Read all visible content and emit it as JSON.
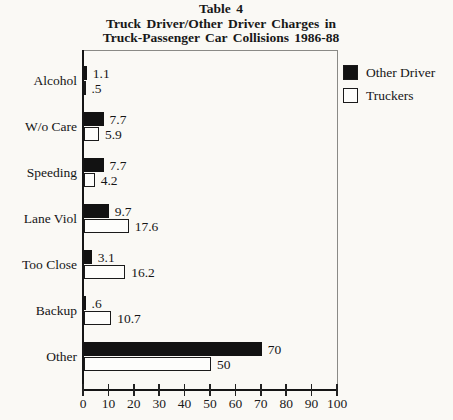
{
  "title": {
    "line1": "Table 4",
    "line2": "Truck Driver/Other Driver Charges in",
    "line3": "Truck-Passenger Car Collisions 1986-88"
  },
  "chart_data": {
    "type": "bar",
    "orientation": "horizontal",
    "title": "Table 4 Truck Driver/Other Driver Charges in Truck-Passenger Car Collisions 1986-88",
    "categories": [
      "Alcohol",
      "W/o Care",
      "Speeding",
      "Lane Viol",
      "Too Close",
      "Backup",
      "Other"
    ],
    "series": [
      {
        "name": "Other Driver",
        "color": "#121212",
        "values": [
          1.1,
          7.7,
          7.7,
          9.7,
          3.1,
          0.6,
          70
        ],
        "labels": [
          "1.1",
          "7.7",
          "7.7",
          "9.7",
          "3.1",
          ".6",
          "70"
        ]
      },
      {
        "name": "Truckers",
        "color": "#fdfdfb",
        "values": [
          0.5,
          5.9,
          4.2,
          17.6,
          16.2,
          10.7,
          50
        ],
        "labels": [
          ".5",
          "5.9",
          "4.2",
          "17.6",
          "16.2",
          "10.7",
          "50"
        ]
      }
    ],
    "xlim": [
      0,
      100
    ],
    "xticks": [
      0,
      10,
      20,
      30,
      40,
      50,
      60,
      70,
      80,
      90,
      100
    ],
    "xtick_labels": [
      "0",
      "10",
      "20",
      "30",
      "40",
      "50",
      "60",
      "70",
      "80",
      "90",
      "100"
    ],
    "grid": false,
    "legend_position": "top-right-outside"
  },
  "colors": {
    "background": "#faf9f5",
    "bar_fill_other_driver": "#121212",
    "bar_fill_truckers": "#fdfdfb",
    "bar_outline": "#1a1a1a",
    "axis": "#151515",
    "frame": "#8a8a86"
  }
}
